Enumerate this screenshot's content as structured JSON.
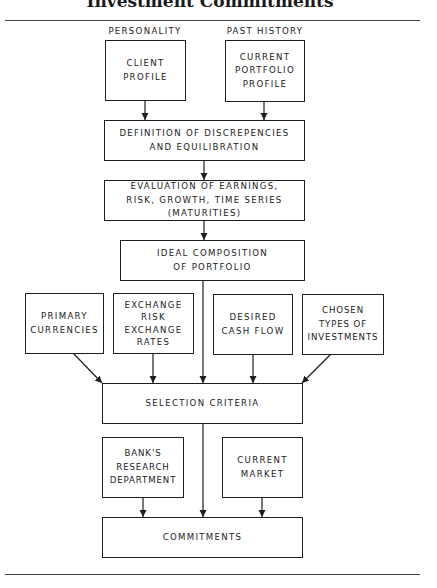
{
  "title": "Investment Commitments",
  "top_labels": {
    "personality": "PERSONALITY",
    "past_history": "PAST HISTORY"
  },
  "nodes": {
    "client_profile": "CLIENT\nPROFILE",
    "current_portfolio_profile": "CURRENT\nPORTFOLIO\nPROFILE",
    "definition": "DEFINITION OF DISCREPENCIES\nAND EQUILIBRATION",
    "evaluation": "EVALUATION OF EARNINGS,\nRISK, GROWTH, TIME SERIES\n(MATURITIES)",
    "ideal_composition": "IDEAL COMPOSITION\nOF PORTFOLIO",
    "primary_currencies": "PRIMARY\nCURRENCIES",
    "exchange_risk": "EXCHANGE\nRISK\nEXCHANGE\nRATES",
    "desired_cash_flow": "DESIRED\nCASH FLOW",
    "chosen_types": "CHOSEN\nTYPES OF\nINVESTMENTS",
    "selection_criteria": "SELECTION CRITERIA",
    "banks_research": "BANK'S\nRESEARCH\nDEPARTMENT",
    "current_market": "CURRENT\nMARKET",
    "commitments": "COMMITMENTS"
  },
  "edges": [
    [
      "client_profile",
      "definition"
    ],
    [
      "current_portfolio_profile",
      "definition"
    ],
    [
      "definition",
      "evaluation"
    ],
    [
      "evaluation",
      "ideal_composition"
    ],
    [
      "ideal_composition",
      "selection_criteria"
    ],
    [
      "primary_currencies",
      "selection_criteria"
    ],
    [
      "exchange_risk",
      "selection_criteria"
    ],
    [
      "desired_cash_flow",
      "selection_criteria"
    ],
    [
      "chosen_types",
      "selection_criteria"
    ],
    [
      "selection_criteria",
      "commitments"
    ],
    [
      "banks_research",
      "commitments"
    ],
    [
      "current_market",
      "commitments"
    ]
  ],
  "colors": {
    "line": "#1e1e1e",
    "text": "#222222",
    "background": "#ffffff"
  }
}
